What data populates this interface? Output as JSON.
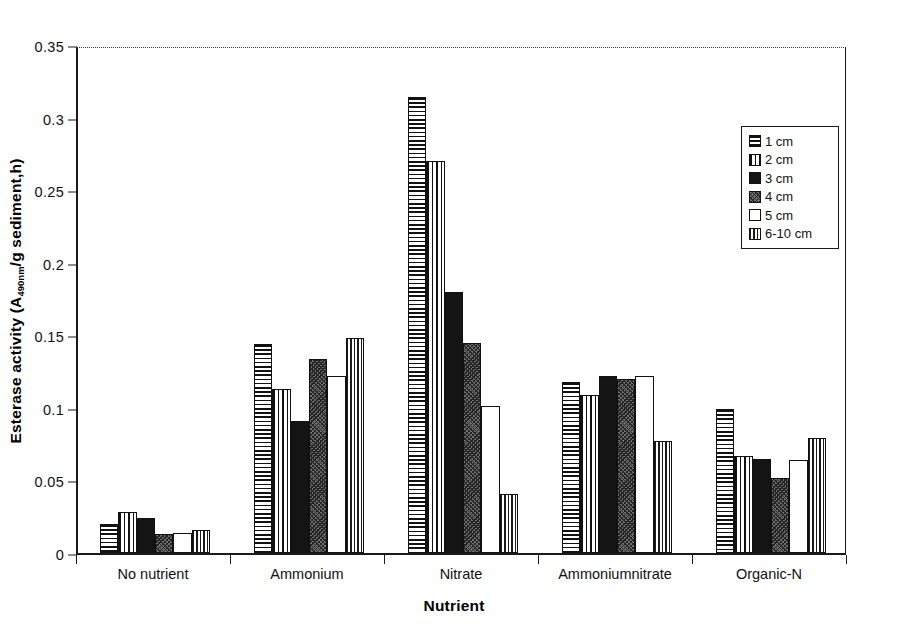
{
  "chart_data": {
    "type": "bar",
    "title": "",
    "xlabel": "Nutrient",
    "ylabel": "Esterase activity (A490nm/g sediment,h)",
    "ylabel_main": "Esterase activity (A",
    "ylabel_sub": "490nm",
    "ylabel_tail": "/g sediment,h)",
    "ylim": [
      0,
      0.35
    ],
    "ytick_labels": [
      "0",
      "0.05",
      "0.1",
      "0.15",
      "0.2",
      "0.25",
      "0.3",
      "0.35"
    ],
    "ytick_values": [
      0,
      0.05,
      0.1,
      0.15,
      0.2,
      0.25,
      0.3,
      0.35
    ],
    "grid": false,
    "legend_position": "upper-right",
    "categories": [
      "No nutrient",
      "Ammonium",
      "Nitrate",
      "Ammoniumnitrate",
      "Organic-N"
    ],
    "series": [
      {
        "name": "1 cm",
        "pattern": "horizontal-lines",
        "values": [
          0.02,
          0.144,
          0.314,
          0.118,
          0.099
        ]
      },
      {
        "name": "2 cm",
        "pattern": "vertical-lines",
        "values": [
          0.028,
          0.113,
          0.27,
          0.109,
          0.067
        ]
      },
      {
        "name": "3 cm",
        "pattern": "solid-black",
        "values": [
          0.024,
          0.091,
          0.18,
          0.122,
          0.065
        ]
      },
      {
        "name": "4 cm",
        "pattern": "dark-stipple",
        "values": [
          0.013,
          0.134,
          0.145,
          0.12,
          0.052
        ]
      },
      {
        "name": "5 cm",
        "pattern": "white",
        "values": [
          0.014,
          0.122,
          0.101,
          0.122,
          0.064
        ]
      },
      {
        "name": "6-10 cm",
        "pattern": "cross-hatch",
        "values": [
          0.016,
          0.148,
          0.041,
          0.077,
          0.079
        ]
      }
    ]
  },
  "legend": {
    "items": [
      {
        "label": "1 cm"
      },
      {
        "label": "2 cm"
      },
      {
        "label": "3 cm"
      },
      {
        "label": "4 cm"
      },
      {
        "label": "5 cm"
      },
      {
        "label": "6-10 cm"
      }
    ]
  },
  "colors": {
    "axis": "#1a1a1a",
    "text": "#111111",
    "background": "#ffffff",
    "bar_outline": "#111111"
  }
}
